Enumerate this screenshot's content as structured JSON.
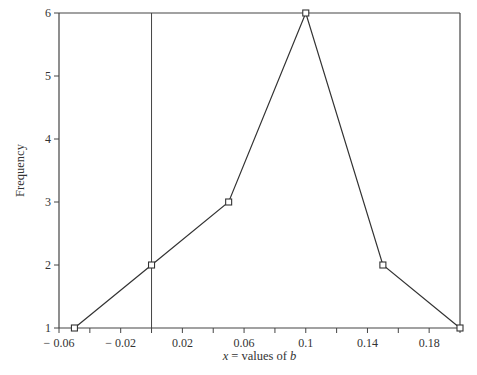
{
  "chart_data": {
    "type": "line",
    "title": "",
    "xlabel_var": "x",
    "xlabel_text": " = values of ",
    "xlabel_b": "b",
    "ylabel": "Frequency",
    "xlim": [
      -0.06,
      0.2
    ],
    "ylim": [
      1,
      6
    ],
    "x_ticks": [
      -0.06,
      -0.04,
      -0.02,
      0,
      0.02,
      0.04,
      0.06,
      0.08,
      0.1,
      0.12,
      0.14,
      0.16,
      0.18,
      0.2
    ],
    "x_tick_labels": [
      {
        "value": -0.06,
        "label": "− 0.06"
      },
      {
        "value": -0.02,
        "label": "− 0.02"
      },
      {
        "value": 0.02,
        "label": "0.02"
      },
      {
        "value": 0.06,
        "label": "0.06"
      },
      {
        "value": 0.1,
        "label": "0.1"
      },
      {
        "value": 0.14,
        "label": "0.14"
      },
      {
        "value": 0.18,
        "label": "0.18"
      }
    ],
    "y_ticks": [
      1,
      2,
      3,
      4,
      5,
      6
    ],
    "y_tick_labels": [
      "1",
      "2",
      "3",
      "4",
      "5",
      "6"
    ],
    "vertical_line_x": 0,
    "grid": false,
    "legend": "none",
    "series": [
      {
        "name": "frequency",
        "marker": "square",
        "x": [
          -0.05,
          0,
          0.05,
          0.1,
          0.15,
          0.2
        ],
        "y": [
          1,
          2,
          3,
          6,
          2,
          1
        ]
      }
    ],
    "colors": {
      "line": "#333333",
      "axis": "#444444",
      "text": "#333333"
    }
  }
}
